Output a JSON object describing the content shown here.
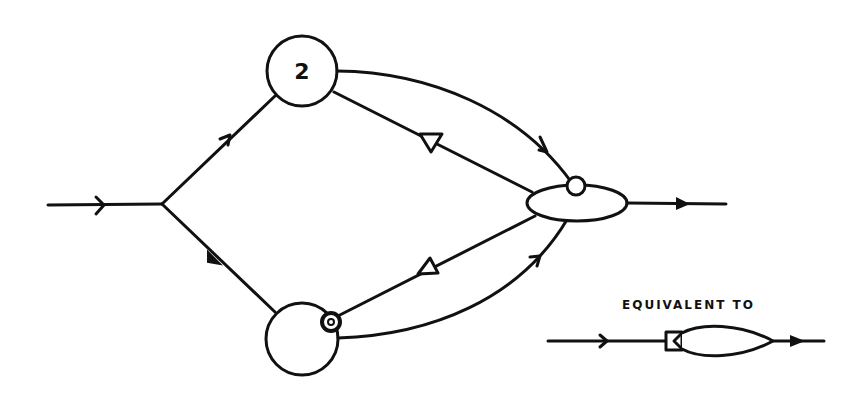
{
  "diagram": {
    "title": "",
    "nodes": [
      {
        "id": "source-split",
        "type": "junction",
        "label": ""
      },
      {
        "id": "node-top",
        "type": "circle",
        "label": "2"
      },
      {
        "id": "node-bottom",
        "type": "circle",
        "label": ""
      },
      {
        "id": "merge-ellipse",
        "type": "ellipse",
        "label": ""
      }
    ],
    "edges": [
      {
        "from": "input",
        "to": "source-split",
        "marker": "open-arrow"
      },
      {
        "from": "source-split",
        "to": "node-top",
        "marker": "open-arrow"
      },
      {
        "from": "source-split",
        "to": "node-bottom",
        "marker": "filled-arrow"
      },
      {
        "from": "node-top",
        "to": "merge-ellipse",
        "path": "curve",
        "marker": "open-arrow"
      },
      {
        "from": "merge-ellipse",
        "to": "node-top",
        "marker": "open-triangle"
      },
      {
        "from": "merge-ellipse",
        "to": "node-bottom",
        "marker": "open-triangle"
      },
      {
        "from": "node-bottom",
        "to": "merge-ellipse",
        "path": "curve",
        "marker": "open-arrow"
      },
      {
        "from": "merge-ellipse",
        "to": "output",
        "marker": "filled-arrow"
      }
    ],
    "annotations": {
      "top_node_label": "2",
      "equivalent_caption": "EQUIVALENT TO"
    },
    "legend": {
      "caption": "EQUIVALENT TO",
      "symbol": "gated-ellipse"
    },
    "colors": {
      "ink": "#111111",
      "background": "#ffffff"
    }
  }
}
